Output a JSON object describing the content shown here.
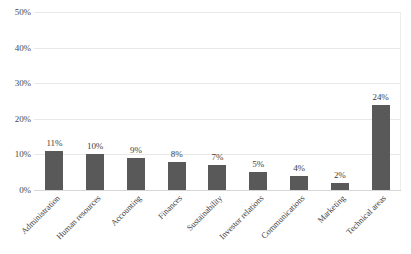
{
  "chart_data": {
    "type": "bar",
    "title": "",
    "subtitle": "",
    "xlabel": "",
    "ylabel": "",
    "categories": [
      "Administration",
      "Human resources",
      "Accounting",
      "Finances",
      "Sustainability",
      "Investor relations",
      "Communications",
      "Marketing",
      "Technical areas"
    ],
    "values": [
      11,
      10,
      9,
      8,
      7,
      5,
      4,
      2,
      24
    ],
    "data_labels": [
      "11%",
      "10%",
      "9%",
      "8%",
      "7%",
      "5%",
      "4%",
      "2%",
      "24%"
    ],
    "ylim": [
      0,
      50
    ],
    "yticks": [
      0,
      10,
      20,
      30,
      40,
      50
    ],
    "ytick_labels": [
      "0%",
      "10%",
      "20%",
      "30%",
      "40%",
      "50%"
    ],
    "grid": true,
    "grid_axis": "y",
    "legend": false,
    "legend_position": "none",
    "bar_color": "#595959",
    "gridline_color": "#e8e8e8",
    "axis_line_color": "#d6d6d6",
    "text_color": "#3f3f3f",
    "background_color": "#ffffff",
    "xtick_label_rotation": 45
  }
}
